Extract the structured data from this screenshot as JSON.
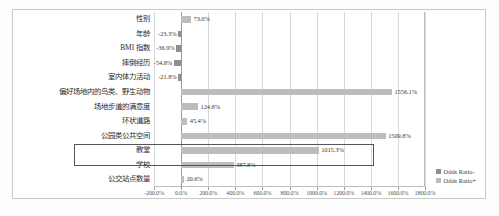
{
  "chart_data": {
    "type": "bar",
    "title": "",
    "subtitle": "",
    "xlabel": "",
    "ylabel": "",
    "orientation": "horizontal",
    "grid": true,
    "legend_position": "right",
    "xlim": [
      -200.0,
      1800.0
    ],
    "xticks": [
      -200.0,
      0.0,
      200.0,
      400.0,
      600.0,
      800.0,
      1000.0,
      1200.0,
      1400.0,
      1600.0,
      1800.0
    ],
    "xtick_labels": [
      "-200.0%",
      "0.0%",
      "200.0%",
      "400.0%",
      "600.0%",
      "800.0%",
      "1000.0%",
      "1200.0%",
      "1400.0%",
      "1600.0%",
      "1800.0%"
    ],
    "categories": [
      "性别",
      "年龄",
      "BMI 指数",
      "摔倒经历",
      "室内体力活动",
      "偏好场地内的鸟类、野生动物",
      "场地步道的满意度",
      "环状道路",
      "公园类公共空间",
      "教堂",
      "学校",
      "公交站点数量"
    ],
    "values": [
      73.0,
      -23.3,
      -36.9,
      -54.8,
      -21.8,
      1556.1,
      124.8,
      45.4,
      1509.8,
      1015.3,
      387.8,
      20.6
    ],
    "data_labels": [
      "73.0%",
      "-23.3%",
      "-36.9%",
      "-54.8%",
      "-21.8%",
      "1556.1%",
      "124.8%",
      "45.4%",
      "1509.8%",
      "1015.3%",
      "387.8%",
      "20.6%"
    ],
    "series": [
      {
        "name": "Odds Ratio-",
        "color": "#8f8f8f"
      },
      {
        "name": "Odds Ratio+",
        "color": "#bdbdbd"
      }
    ],
    "highlighted_category": "教堂"
  },
  "legend": {
    "items": [
      {
        "label": "Odds Ratio-",
        "kind": "neg"
      },
      {
        "label": "Odds Ratio+",
        "kind": "pos"
      }
    ]
  },
  "colors": {
    "negative_bar": "#8f8f8f",
    "positive_bar": "#bdbdbd",
    "gridline": "#d8d8d8",
    "axis": "#9a9a9a",
    "highlight_border": "#55555a",
    "frame": "#c9c9c9"
  }
}
